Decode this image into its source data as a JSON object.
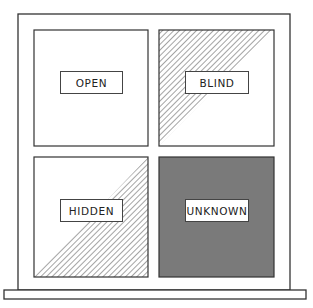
{
  "diagram": {
    "type": "johari-window",
    "quadrants": [
      {
        "id": "open",
        "label": "OPEN",
        "fill": "none"
      },
      {
        "id": "blind",
        "label": "BLIND",
        "fill": "hatched-upper-left-triangle"
      },
      {
        "id": "hidden",
        "label": "HIDDEN",
        "fill": "hatched-lower-right-triangle"
      },
      {
        "id": "unknown",
        "label": "UNKNOWN",
        "fill": "solid"
      }
    ],
    "colors": {
      "line": "#333333",
      "hatch": "#666666",
      "unknown_fill": "#7a7a7a",
      "background": "#ffffff"
    }
  }
}
